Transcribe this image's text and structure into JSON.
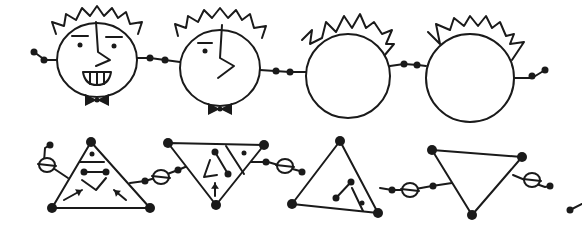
{
  "illustration": {
    "background": "#ffffff",
    "ink_color": "#1a1a1a",
    "rows": [
      {
        "name": "faces-row",
        "faces": [
          {
            "id": "face-1-smiling",
            "cx": 97,
            "cy": 60,
            "rx": 40,
            "ry": 37,
            "hair_spikes": [
              [
                56,
                34
              ],
              [
                52,
                22
              ],
              [
                64,
                26
              ],
              [
                66,
                14
              ],
              [
                76,
                20
              ],
              [
                82,
                8
              ],
              [
                90,
                16
              ],
              [
                97,
                6
              ],
              [
                104,
                16
              ],
              [
                112,
                8
              ],
              [
                118,
                18
              ],
              [
                126,
                12
              ],
              [
                130,
                24
              ],
              [
                142,
                22
              ],
              [
                138,
                34
              ]
            ],
            "eyes": [
              {
                "x": 80,
                "y": 45,
                "brow": [
                  [
                    72,
                    36
                  ],
                  [
                    88,
                    36
                  ]
                ]
              },
              {
                "x": 114,
                "y": 46,
                "brow": [
                  [
                    106,
                    37
                  ],
                  [
                    122,
                    37
                  ]
                ]
              }
            ],
            "nose": [
              [
                96,
                22
              ],
              [
                98,
                52
              ],
              [
                110,
                60
              ],
              [
                96,
                66
              ]
            ],
            "mouth": "teeth",
            "bowtie": true
          },
          {
            "id": "face-2-profile",
            "cx": 220,
            "cy": 68,
            "rx": 40,
            "ry": 38,
            "hair_spikes": [
              [
                178,
                36
              ],
              [
                175,
                24
              ],
              [
                186,
                28
              ],
              [
                188,
                16
              ],
              [
                198,
                22
              ],
              [
                204,
                10
              ],
              [
                212,
                18
              ],
              [
                220,
                8
              ],
              [
                228,
                18
              ],
              [
                236,
                10
              ],
              [
                242,
                20
              ],
              [
                250,
                14
              ],
              [
                254,
                28
              ],
              [
                266,
                26
              ],
              [
                262,
                38
              ]
            ],
            "eyes": [
              {
                "x": 205,
                "y": 51,
                "brow": [
                  [
                    198,
                    43
                  ],
                  [
                    212,
                    43
                  ]
                ]
              }
            ],
            "nose": [
              [
                222,
                25
              ],
              [
                220,
                58
              ],
              [
                234,
                66
              ],
              [
                218,
                78
              ]
            ],
            "mouth": "none",
            "bowtie": true
          },
          {
            "id": "face-3-blank",
            "cx": 348,
            "cy": 76,
            "rx": 42,
            "ry": 42,
            "hair_spikes": [
              [
                302,
                40
              ],
              [
                312,
                30
              ],
              [
                310,
                44
              ],
              [
                322,
                38
              ],
              [
                326,
                22
              ],
              [
                336,
                32
              ],
              [
                344,
                16
              ],
              [
                352,
                28
              ],
              [
                360,
                14
              ],
              [
                366,
                28
              ],
              [
                374,
                22
              ],
              [
                382,
                34
              ],
              [
                392,
                30
              ],
              [
                386,
                44
              ],
              [
                394,
                44
              ],
              [
                384,
                56
              ]
            ],
            "eyes": [],
            "nose": [],
            "mouth": "none",
            "bowtie": false
          },
          {
            "id": "face-4-blank",
            "cx": 470,
            "cy": 78,
            "rx": 44,
            "ry": 44,
            "hair_spikes": [
              [
                428,
                32
              ],
              [
                440,
                44
              ],
              [
                436,
                24
              ],
              [
                450,
                30
              ],
              [
                454,
                18
              ],
              [
                464,
                26
              ],
              [
                470,
                16
              ],
              [
                478,
                26
              ],
              [
                486,
                16
              ],
              [
                492,
                28
              ],
              [
                500,
                22
              ],
              [
                506,
                36
              ],
              [
                514,
                34
              ],
              [
                510,
                44
              ],
              [
                524,
                42
              ],
              [
                512,
                60
              ]
            ],
            "eyes": [],
            "nose": [],
            "mouth": "none",
            "bowtie": false
          }
        ],
        "connectors": [
          {
            "from": [
              57,
              60
            ],
            "path": [
              [
                57,
                60
              ],
              [
                45,
                60
              ],
              [
                34,
                52
              ]
            ],
            "beads": [
              [
                44,
                60
              ],
              [
                34,
                52
              ]
            ]
          },
          {
            "from": [
              137,
              58
            ],
            "path": [
              [
                137,
                58
              ],
              [
                150,
                58
              ],
              [
                165,
                60
              ],
              [
                180,
                62
              ]
            ],
            "beads": [
              [
                150,
                58
              ],
              [
                165,
                60
              ]
            ]
          },
          {
            "from": [
              260,
              70
            ],
            "path": [
              [
                260,
                70
              ],
              [
                275,
                71
              ],
              [
                290,
                72
              ],
              [
                306,
                72
              ]
            ],
            "beads": [
              [
                276,
                71
              ],
              [
                290,
                72
              ]
            ]
          },
          {
            "from": [
              390,
              66
            ],
            "path": [
              [
                390,
                66
              ],
              [
                404,
                64
              ],
              [
                418,
                65
              ],
              [
                426,
                66
              ]
            ],
            "beads": [
              [
                404,
                64
              ],
              [
                417,
                65
              ]
            ]
          },
          {
            "from": [
              514,
              78
            ],
            "path": [
              [
                514,
                78
              ],
              [
                532,
                78
              ],
              [
                545,
                70
              ]
            ],
            "beads": [
              [
                532,
                76
              ],
              [
                545,
                70
              ]
            ]
          }
        ]
      },
      {
        "name": "triangles-row",
        "triangles": [
          {
            "id": "triangle-1-face",
            "points": [
              [
                91,
                142
              ],
              [
                52,
                208
              ],
              [
                150,
                208
              ]
            ],
            "divider": [
              [
                80,
                162
              ],
              [
                104,
                162
              ]
            ],
            "details": {
              "dot": [
                92,
                154
              ],
              "bar": [
                [
                  84,
                  172
                ],
                [
                  106,
                  172
                ]
              ],
              "chevron": [
                [
                  82,
                  180
                ],
                [
                  96,
                  190
                ],
                [
                  106,
                  178
                ]
              ],
              "arrows": [
                {
                  "from": [
                    64,
                    200
                  ],
                  "to": [
                    82,
                    190
                  ]
                },
                {
                  "from": [
                    126,
                    200
                  ],
                  "to": [
                    114,
                    190
                  ]
                }
              ]
            }
          },
          {
            "id": "triangle-2-inverted",
            "points": [
              [
                168,
                143
              ],
              [
                264,
                145
              ],
              [
                216,
                205
              ]
            ],
            "divider": [
              [
                226,
                146
              ],
              [
                244,
                174
              ]
            ],
            "details": {
              "dot": [
                244,
                153
              ],
              "bar": [
                [
                  215,
                  152
                ],
                [
                  228,
                  174
                ]
              ],
              "angle": [
                [
                  210,
                  160
                ],
                [
                  204,
                  177
                ],
                [
                  217,
                  175
                ]
              ],
              "arrow_up": {
                "from": [
                  215,
                  196
                ],
                "to": [
                  215,
                  183
                ]
              }
            }
          },
          {
            "id": "triangle-3-split",
            "points": [
              [
                340,
                141
              ],
              [
                292,
                204
              ],
              [
                378,
                213
              ]
            ],
            "divider": [
              [
                352,
                188
              ],
              [
                363,
                211
              ]
            ],
            "details": {
              "bar": [
                [
                  336,
                  198
                ],
                [
                  351,
                  182
                ]
              ],
              "dot": [
                362,
                203
              ]
            }
          },
          {
            "id": "triangle-4-empty",
            "points": [
              [
                432,
                150
              ],
              [
                522,
                157
              ],
              [
                472,
                215
              ]
            ],
            "divider": null,
            "details": {}
          }
        ],
        "connectors": [
          {
            "path": [
              [
                68,
                178
              ],
              [
                44,
                162
              ],
              [
                45,
                148
              ],
              [
                50,
                145
              ]
            ],
            "beads": [
              [
                50,
                145
              ]
            ],
            "rings": [
              [
                47,
                165
              ]
            ]
          },
          {
            "path": [
              [
                130,
                183
              ],
              [
                145,
                181
              ],
              [
                162,
                176
              ],
              [
                178,
                170
              ],
              [
                190,
                165
              ]
            ],
            "beads": [
              [
                145,
                181
              ],
              [
                178,
                170
              ]
            ],
            "rings": [
              [
                161,
                177
              ]
            ]
          },
          {
            "path": [
              [
                250,
                162
              ],
              [
                268,
                162
              ],
              [
                285,
                167
              ],
              [
                300,
                171
              ]
            ],
            "beads": [
              [
                266,
                162
              ],
              [
                302,
                172
              ]
            ],
            "rings": [
              [
                285,
                166
              ]
            ]
          },
          {
            "path": [
              [
                380,
                188
              ],
              [
                392,
                190
              ],
              [
                410,
                190
              ],
              [
                432,
                186
              ],
              [
                452,
                183
              ]
            ],
            "beads": [
              [
                392,
                190
              ],
              [
                433,
                186
              ]
            ],
            "rings": [
              [
                410,
                190
              ]
            ]
          },
          {
            "path": [
              [
                513,
                175
              ],
              [
                525,
                180
              ],
              [
                545,
                187
              ],
              [
                550,
                186
              ]
            ],
            "beads": [
              [
                550,
                186
              ]
            ],
            "rings": [
              [
                532,
                180
              ]
            ]
          },
          {
            "path": [
              [
                570,
                210
              ],
              [
                582,
                204
              ]
            ],
            "beads": [
              [
                570,
                210
              ]
            ],
            "rings": []
          }
        ]
      }
    ]
  }
}
